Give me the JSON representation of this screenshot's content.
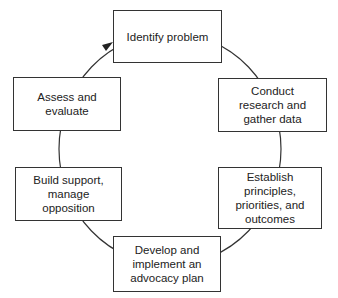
{
  "diagram": {
    "type": "cycle",
    "direction": "clockwise",
    "colors": {
      "stroke": "#333333",
      "fill": "#ffffff",
      "text": "#222222"
    },
    "steps": [
      {
        "id": "identify",
        "label": "Identify problem"
      },
      {
        "id": "research",
        "label": "Conduct research and gather data"
      },
      {
        "id": "establish",
        "label": "Establish principles, priorities, and outcomes"
      },
      {
        "id": "develop",
        "label": "Develop and implement an advocacy plan"
      },
      {
        "id": "build",
        "label": "Build support, manage opposition"
      },
      {
        "id": "assess",
        "label": "Assess and evaluate"
      }
    ],
    "arrow": {
      "from": "assess",
      "to": "identify"
    }
  }
}
